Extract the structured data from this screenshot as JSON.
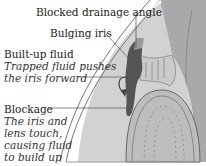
{
  "diagram": {
    "labels": {
      "blocked_drainage_angle": "Blocked drainage angle",
      "bulging_iris": "Bulging iris",
      "built_up_fluid": {
        "title": "Built-up fluid",
        "desc_line1": "Trapped fluid pushes",
        "desc_line2": "the iris forward"
      },
      "blockage": {
        "title": "Blockage",
        "desc_line1": "The iris and",
        "desc_line2": "lens touch,",
        "desc_line3": "causing fluid",
        "desc_line4": "to build up"
      }
    },
    "colors": {
      "cornea": "#f2f2f2",
      "sclera": "#a9a9a9",
      "aqueous": "#d4d4d4",
      "iris": "#555555",
      "lens": "#bdbdbd",
      "leader": "#555555"
    }
  }
}
